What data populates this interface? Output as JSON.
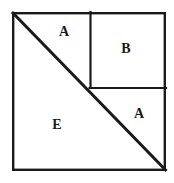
{
  "figure": {
    "background_color": "#ffffff",
    "stroke_color": "#1a1a1a",
    "outer_square": {
      "name": "outer-square",
      "x": 12,
      "y": 12,
      "width": 154,
      "height": 159,
      "stroke_width": 2.4
    },
    "inner_square": {
      "name": "inner-square-b",
      "x": 90,
      "y": 12,
      "width": 76,
      "height": 76,
      "stroke_width": 2.2
    },
    "divider_horizontal": {
      "name": "horizontal-divider",
      "x1": 90,
      "y1": 88,
      "x2": 166,
      "y2": 88,
      "stroke_width": 2.2
    },
    "diagonal": {
      "name": "main-diagonal",
      "x1": 12,
      "y1": 12,
      "x2": 166,
      "y2": 171,
      "stroke_width": 3
    },
    "labels": [
      {
        "id": "label-a-top",
        "text": "A",
        "x": 64,
        "y": 32
      },
      {
        "id": "label-b",
        "text": "B",
        "x": 126,
        "y": 49
      },
      {
        "id": "label-a-right",
        "text": "A",
        "x": 139,
        "y": 114
      },
      {
        "id": "label-e",
        "text": "E",
        "x": 57,
        "y": 125
      }
    ]
  }
}
